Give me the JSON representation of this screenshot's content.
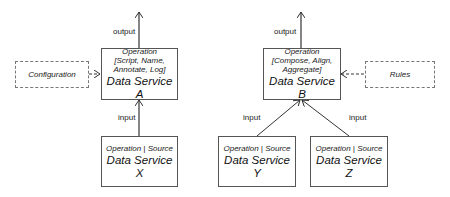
{
  "diagram": {
    "labels": {
      "output_a": "output",
      "output_b": "output",
      "input_a": "input",
      "input_y": "input",
      "input_z": "input"
    },
    "external": {
      "configuration": "Configuration",
      "rules": "Rules"
    },
    "nodes": {
      "a": {
        "op_line1": "Operation",
        "op_line2": "[Script, Name,",
        "op_line3": "Annotate, Log]",
        "name": "Data Service A"
      },
      "b": {
        "op_line1": "Operation",
        "op_line2": "[Compose, Align,",
        "op_line3": "Aggregate]",
        "name": "Data Service B"
      },
      "x": {
        "op": "Operation | Source",
        "name": "Data Service X"
      },
      "y": {
        "op": "Operation | Source",
        "name": "Data Service Y"
      },
      "z": {
        "op": "Operation | Source",
        "name": "Data Service Z"
      }
    },
    "edges": [
      {
        "from": "Data Service A",
        "to": "output",
        "style": "solid"
      },
      {
        "from": "Configuration",
        "to": "Data Service A",
        "style": "dashed"
      },
      {
        "from": "Data Service X",
        "to": "Data Service A",
        "label": "input",
        "style": "solid"
      },
      {
        "from": "Data Service B",
        "to": "output",
        "style": "solid"
      },
      {
        "from": "Rules",
        "to": "Data Service B",
        "style": "dashed"
      },
      {
        "from": "Data Service Y",
        "to": "Data Service B",
        "label": "input",
        "style": "solid"
      },
      {
        "from": "Data Service Z",
        "to": "Data Service B",
        "label": "input",
        "style": "solid"
      }
    ]
  }
}
